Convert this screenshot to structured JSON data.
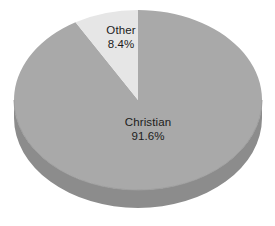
{
  "chart_data": {
    "type": "pie",
    "title": "",
    "subtitle": "",
    "xlabel": "",
    "ylabel": "",
    "grid": false,
    "legend_position": "none",
    "style": "3d-pie",
    "labels_inside_slices": true,
    "start_angle_deg": 0,
    "direction": "counterclockwise",
    "categories": [
      "Christian",
      "Other"
    ],
    "values": [
      91.6,
      8.4
    ],
    "unit": "%",
    "slices": [
      {
        "name": "Christian",
        "value": 91.6,
        "value_text": "91.6%",
        "color": "#a9a9a9",
        "side_color": "#8c8c8c"
      },
      {
        "name": "Other",
        "value": 8.4,
        "value_text": "8.4%",
        "color": "#e6e6e6",
        "side_color": "#c4c4c4"
      }
    ]
  },
  "colors": {
    "background": "#ffffff",
    "christian_top": "#a9a9a9",
    "christian_side": "#8c8c8c",
    "other_top": "#e6e6e6",
    "other_side": "#c8c8c8",
    "text": "#1c1c1c",
    "edge": "#9e9e9e"
  }
}
